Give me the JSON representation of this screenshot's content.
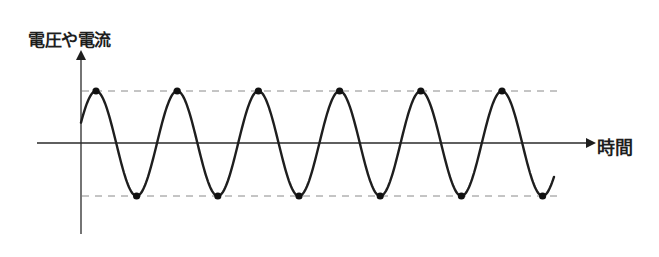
{
  "diagram": {
    "y_axis_label": "電圧や電流",
    "x_axis_label": "時間",
    "colors": {
      "curve": "#1e1e1e",
      "axis": "#2a2a2a",
      "dashed": "#8a8a8a",
      "marker": "#111111",
      "background": "#ffffff"
    }
  },
  "chart_data": {
    "type": "line",
    "title": "",
    "xlabel": "時間",
    "ylabel": "電圧や電流",
    "waveform": "sine",
    "cycles_shown": 6,
    "peaks_marked": 6,
    "troughs_marked": 6,
    "amplitude_lines": [
      "max",
      "min"
    ],
    "grid": false,
    "legend": null
  }
}
